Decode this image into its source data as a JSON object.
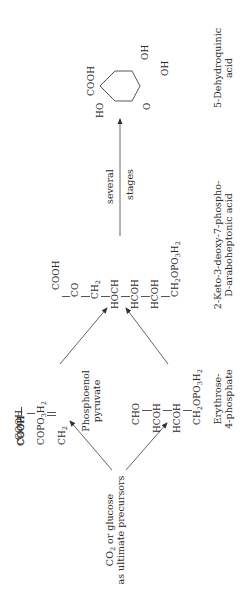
{
  "precursor": {
    "line1": "CO",
    "line1_sub": "2",
    "line1_rest": " or glucose",
    "line2": "as ultimate precursors"
  },
  "pep": {
    "atoms": [
      "COOH",
      "COPO",
      "CH"
    ],
    "atom2_sub": "3",
    "atom2_suffix": "H",
    "atom2_suffix_sub": "2",
    "atom3_sub": "2",
    "name_line1": "Phosphoenol",
    "name_line2": "pyruvate"
  },
  "erythrose": {
    "atoms": [
      "CHO",
      "HCOH",
      "HCOH",
      "CH"
    ],
    "atom4_sub": "2",
    "atom4_rest": "OPO",
    "atom4_rest_sub": "3",
    "atom4_end": "H",
    "atom4_end_sub": "2",
    "name_line1": "Erythrose-",
    "name_line2": "4-phosphate"
  },
  "dahp": {
    "atoms": [
      "COOH",
      "CO",
      "CH",
      "HOCH",
      "HCOH",
      "HCOH",
      "CH"
    ],
    "atom3_sub": "2",
    "atom7_sub": "2",
    "atom7_rest": "OPO",
    "atom7_rest_sub": "3",
    "atom7_end": "H",
    "atom7_end_sub": "2",
    "name_line1": "2-Keto-3-deoxy-7-phospho-",
    "name_line2": "D-araboheptonic acid"
  },
  "step_arrow": {
    "label_above": "several",
    "label_below": "stages"
  },
  "dehydroquinic": {
    "substituents": {
      "cooh": "COOH",
      "ho": "HO",
      "oh_top": "OH",
      "oh_bottom": "OH",
      "keto": "O"
    },
    "name_line1": "5-Dehydroquinic",
    "name_line2": "acid"
  }
}
